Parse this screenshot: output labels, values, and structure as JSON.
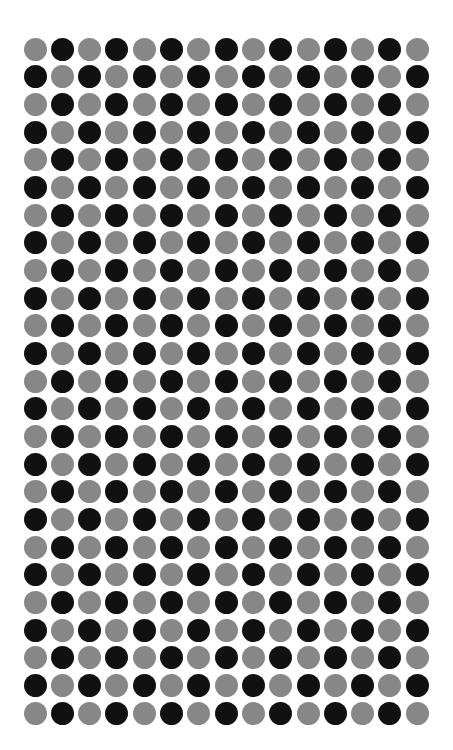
{
  "pattern": {
    "type": "checkerboard-dot-grid",
    "rows": 25,
    "columns": 15,
    "first_center_x": 35,
    "first_center_y": 49,
    "spacing_x": 27.3,
    "spacing_y": 27.67,
    "dot_diameter": 23,
    "first_dot_color": "gray"
  },
  "colors": {
    "gray": "#878787",
    "black": "#111111",
    "background": "#ffffff"
  }
}
